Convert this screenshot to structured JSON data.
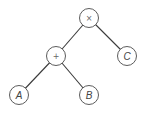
{
  "diagram": {
    "type": "expression-tree",
    "nodes": [
      {
        "id": "times",
        "label": "×",
        "kind": "operator",
        "cx": 89,
        "cy": 18
      },
      {
        "id": "plus",
        "label": "+",
        "kind": "operator",
        "cx": 56,
        "cy": 56
      },
      {
        "id": "C",
        "label": "C",
        "kind": "operand",
        "cx": 127,
        "cy": 56
      },
      {
        "id": "A",
        "label": "A",
        "kind": "operand",
        "cx": 19,
        "cy": 95
      },
      {
        "id": "B",
        "label": "B",
        "kind": "operand",
        "cx": 89,
        "cy": 95
      }
    ],
    "edges": [
      {
        "from": "times",
        "to": "plus"
      },
      {
        "from": "times",
        "to": "C"
      },
      {
        "from": "plus",
        "to": "A"
      },
      {
        "from": "plus",
        "to": "B"
      }
    ],
    "node_radius": 9.5,
    "colors": {
      "stroke": "#4a4a4a",
      "fill": "#ffffff",
      "text": "#444444"
    }
  }
}
